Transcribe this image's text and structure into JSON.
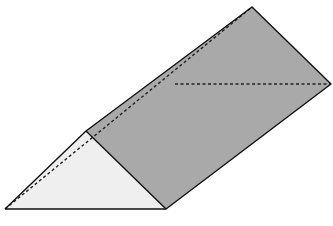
{
  "diagram": {
    "type": "triangular-prism",
    "colors": {
      "background": "#ffffff",
      "front_face": "#efefef",
      "side_face": "#a9a9a9",
      "edge": "#111111",
      "hidden_edge": "#222222"
    },
    "vertices": {
      "A_bottom_left": [
        5,
        209
      ],
      "B_bottom_mid": [
        166,
        209
      ],
      "C_apex_front": [
        86,
        131
      ],
      "D_apex_back": [
        252,
        7
      ],
      "E_right": [
        331,
        84
      ],
      "F_hidden_bottom_back": [
        175,
        84
      ]
    }
  }
}
